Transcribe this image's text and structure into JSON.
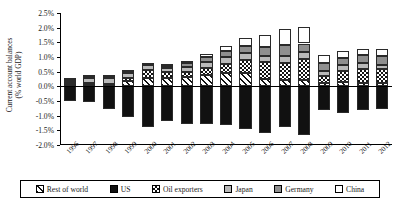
{
  "chart_data": {
    "type": "bar",
    "subtype": "stacked-bar-diverging",
    "title": "",
    "xlabel": "",
    "ylabel": "Current account balances (% world GDP)",
    "ylabel_line1": "Current account balances",
    "ylabel_line2": "(% world GDP)",
    "ylim": [
      -2.0,
      2.5
    ],
    "ytick_step": 0.5,
    "ytick_labels": [
      "2.5%",
      "2.0%",
      "1.5%",
      "1.0%",
      "0.5%",
      "0.0%",
      "-0.5%",
      "-1.0%",
      "-1.5%",
      "-2.0%"
    ],
    "ytick_values": [
      2.5,
      2.0,
      1.5,
      1.0,
      0.5,
      0.0,
      -0.5,
      -1.0,
      -1.5,
      -2.0
    ],
    "grid": false,
    "legend_position": "bottom",
    "categories": [
      "1996",
      "1997",
      "1998",
      "1999",
      "2000",
      "2001",
      "2002",
      "2003",
      "2004",
      "2005",
      "2006",
      "2007",
      "2008",
      "2009",
      "2010",
      "2011",
      "2012"
    ],
    "series": [
      {
        "name": "Rest of world",
        "pattern": "diagonal-hatch",
        "values": [
          0.05,
          0.07,
          0.05,
          0.18,
          0.3,
          0.3,
          0.33,
          0.4,
          0.45,
          0.45,
          0.24,
          0.2,
          0.22,
          0.13,
          0.14,
          0.12,
          0.12
        ]
      },
      {
        "name": "US",
        "pattern": "solid-black",
        "values": [
          -0.5,
          -0.52,
          -0.78,
          -1.05,
          -1.38,
          -1.18,
          -1.28,
          -1.3,
          -1.33,
          -1.46,
          -1.6,
          -1.4,
          -1.65,
          -0.8,
          -0.92,
          -0.82,
          -0.78
        ]
      },
      {
        "name": "Oil exporters",
        "pattern": "checkerboard",
        "values": [
          0.05,
          0.05,
          0.02,
          0.12,
          0.25,
          0.18,
          0.15,
          0.22,
          0.32,
          0.45,
          0.58,
          0.6,
          0.72,
          0.22,
          0.38,
          0.48,
          0.48
        ]
      },
      {
        "name": "Japan",
        "pattern": "light-gray",
        "values": [
          0.1,
          0.18,
          0.22,
          0.18,
          0.18,
          0.16,
          0.18,
          0.22,
          0.24,
          0.22,
          0.22,
          0.25,
          0.22,
          0.18,
          0.2,
          0.18,
          0.12
        ]
      },
      {
        "name": "Germany",
        "pattern": "dark-gray-stipple",
        "values": [
          0.02,
          0.02,
          0.02,
          0.02,
          0.03,
          0.06,
          0.12,
          0.15,
          0.2,
          0.25,
          0.3,
          0.35,
          0.3,
          0.25,
          0.25,
          0.28,
          0.3
        ]
      },
      {
        "name": "China",
        "pattern": "white",
        "values": [
          0.05,
          0.08,
          0.07,
          0.05,
          0.05,
          0.05,
          0.07,
          0.1,
          0.17,
          0.28,
          0.4,
          0.55,
          0.55,
          0.3,
          0.24,
          0.22,
          0.26
        ]
      }
    ],
    "stack_order_positive": [
      "Rest of world",
      "Oil exporters",
      "Japan",
      "Germany",
      "China"
    ],
    "stack_order_negative": [
      "US"
    ]
  },
  "legend": {
    "items": [
      {
        "label": "Rest of world",
        "swatch": "hatch-swatch"
      },
      {
        "label": "US",
        "swatch": "black-swatch"
      },
      {
        "label": "Oil exporters",
        "swatch": "checker-swatch"
      },
      {
        "label": "Japan",
        "swatch": "lightgray-swatch"
      },
      {
        "label": "Germany",
        "swatch": "darkgray-swatch"
      },
      {
        "label": "China",
        "swatch": "white-swatch"
      }
    ]
  }
}
